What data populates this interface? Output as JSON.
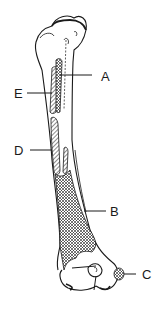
{
  "diagram": {
    "stroke_color": "#1a1a1a",
    "background": "#ffffff",
    "labels": [
      {
        "id": "A",
        "text": "A",
        "x": 101,
        "y": 71
      },
      {
        "id": "B",
        "text": "B",
        "x": 111,
        "y": 208
      },
      {
        "id": "C",
        "text": "C",
        "x": 143,
        "y": 269
      },
      {
        "id": "D",
        "text": "D",
        "x": 14,
        "y": 149
      },
      {
        "id": "E",
        "text": "E",
        "x": 14,
        "y": 89
      }
    ]
  }
}
